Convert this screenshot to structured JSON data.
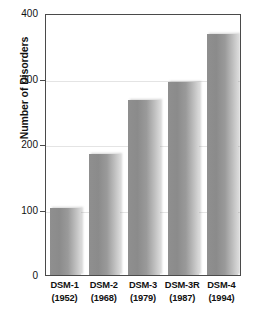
{
  "chart_data": {
    "type": "bar",
    "title": "",
    "xlabel": "",
    "ylabel": "Number of Disorders",
    "categories": [
      "DSM-1",
      "DSM-2",
      "DSM-3",
      "DSM-3R",
      "DSM-4"
    ],
    "category_sublabels": [
      "(1952)",
      "(1968)",
      "(1979)",
      "(1987)",
      "(1994)"
    ],
    "values": [
      103,
      185,
      267,
      295,
      368
    ],
    "ylim": [
      0,
      400
    ],
    "yticks": [
      0,
      100,
      200,
      300,
      400
    ],
    "ytick_labels": [
      "0",
      "100",
      "200",
      "300",
      "400"
    ],
    "grid": true,
    "grid_axis": "y",
    "legend": false,
    "bar_color": "#8f8f8f",
    "bar_color_light": "#d8d8d8",
    "axis_color": "#4a4a4a",
    "gridline_color": "#e4e4e4",
    "text_color": "#111111"
  }
}
